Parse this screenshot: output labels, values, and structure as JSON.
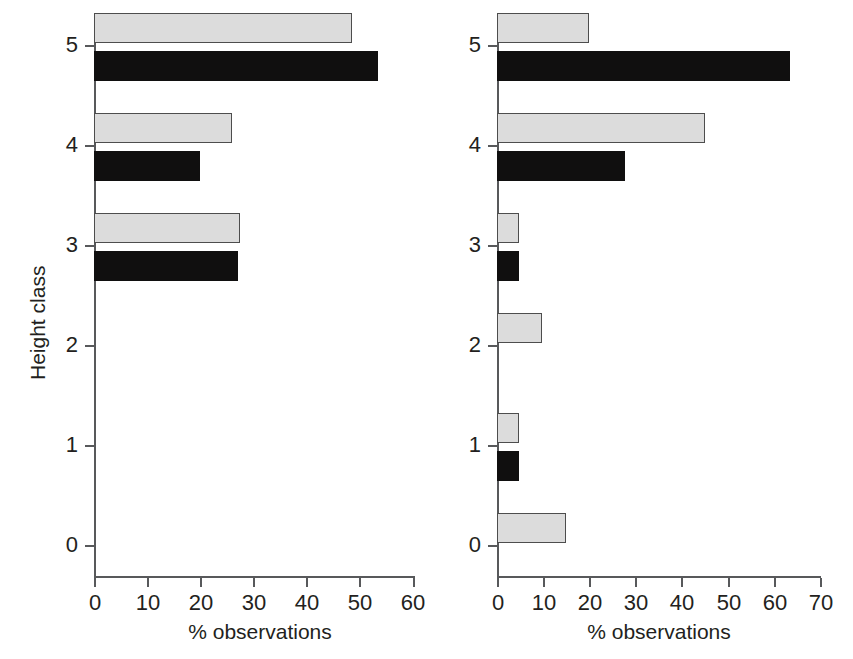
{
  "chart_data": [
    {
      "type": "bar",
      "panel": "left",
      "orientation": "horizontal",
      "title": "",
      "xlabel": "% observations",
      "ylabel": "Height class",
      "xlim": [
        0,
        60
      ],
      "xticks": [
        0,
        10,
        20,
        30,
        40,
        50,
        60
      ],
      "ylim": [
        -0.5,
        5.5
      ],
      "yticks": [
        0,
        1,
        2,
        3,
        4,
        5
      ],
      "categories": [
        "0",
        "1",
        "2",
        "3",
        "4",
        "5"
      ],
      "grid": false,
      "legend": "none",
      "series": [
        {
          "name": "light",
          "color": "#dcdcdc",
          "values": [
            0,
            0,
            0,
            27.5,
            26.0,
            48.5
          ]
        },
        {
          "name": "dark",
          "color": "#100f0f",
          "values": [
            0,
            0,
            0,
            27.0,
            20.0,
            53.5
          ]
        }
      ]
    },
    {
      "type": "bar",
      "panel": "right",
      "orientation": "horizontal",
      "title": "",
      "xlabel": "% observations",
      "ylabel": "Height class",
      "xlim": [
        0,
        70
      ],
      "xticks": [
        0,
        10,
        20,
        30,
        40,
        50,
        60,
        70
      ],
      "ylim": [
        -0.5,
        5.5
      ],
      "yticks": [
        0,
        1,
        2,
        3,
        4,
        5
      ],
      "categories": [
        "0",
        "1",
        "2",
        "3",
        "4",
        "5"
      ],
      "grid": false,
      "legend": "none",
      "series": [
        {
          "name": "light",
          "color": "#dcdcdc",
          "values": [
            15.0,
            4.8,
            9.8,
            4.8,
            45.0,
            20.0
          ]
        },
        {
          "name": "dark",
          "color": "#100f0f",
          "values": [
            0,
            4.8,
            0,
            4.8,
            27.8,
            63.5
          ]
        }
      ]
    }
  ],
  "left_chart": {
    "ylabel": "Height class",
    "xlabel": "% observations",
    "ytick_labels": [
      "5",
      "4",
      "3",
      "2",
      "1",
      "0"
    ],
    "xtick_labels": [
      "0",
      "10",
      "20",
      "30",
      "40",
      "50",
      "60"
    ]
  },
  "right_chart": {
    "ylabel": "Height class",
    "xlabel": "% observations",
    "ytick_labels": [
      "5",
      "4",
      "3",
      "2",
      "1",
      "0"
    ],
    "xtick_labels": [
      "0",
      "10",
      "20",
      "30",
      "40",
      "50",
      "60",
      "70"
    ]
  }
}
